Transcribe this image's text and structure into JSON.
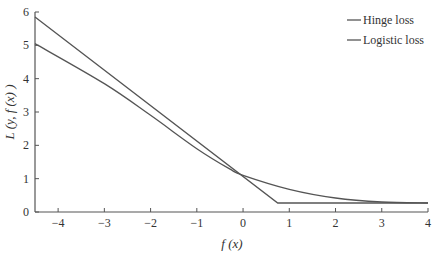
{
  "chart_data": {
    "type": "line",
    "title": "",
    "xlabel": "f (x)",
    "ylabel": "L (y, f (x) )",
    "xlim": [
      -4.5,
      4
    ],
    "ylim": [
      0,
      6
    ],
    "xticks": [
      -4,
      -3,
      -2,
      -1,
      0,
      1,
      2,
      3,
      4
    ],
    "yticks": [
      0,
      1,
      2,
      3,
      4,
      5,
      6
    ],
    "grid": false,
    "legend_position": "upper right",
    "series": [
      {
        "name": "Hinge loss",
        "color": "#555555",
        "x": [
          -4.5,
          0.75,
          4
        ],
        "y": [
          5.85,
          0.27,
          0.27
        ]
      },
      {
        "name": "Logistic loss",
        "color": "#555555",
        "x": [
          -4.5,
          -3,
          -2,
          -1,
          -0.3,
          0,
          1,
          2,
          3,
          4
        ],
        "y": [
          5.05,
          3.85,
          2.9,
          1.9,
          1.3,
          1.1,
          0.68,
          0.42,
          0.3,
          0.27
        ]
      }
    ]
  },
  "legend": [
    "Hinge loss",
    "Logistic loss"
  ],
  "axes": {
    "xlabel": "f (x)",
    "ylabel": "L (y, f (x) )"
  }
}
